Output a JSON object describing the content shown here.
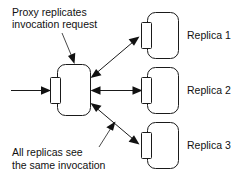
{
  "diagram": {
    "background_color": "#ffffff",
    "line_color": "#1a1a1a",
    "text_color": "#111111",
    "annotations": {
      "top": {
        "line1": "Proxy replicates",
        "line2": "invocation request"
      },
      "bottom": {
        "line1": "All replicas see",
        "line2": "the same invocation"
      }
    },
    "nodes": {
      "proxy": {
        "label": ""
      },
      "replicas": [
        {
          "label": "Replica 1"
        },
        {
          "label": "Replica 2"
        },
        {
          "label": "Replica 3"
        }
      ]
    },
    "connections": [
      {
        "name": "client-to-proxy",
        "from": "client",
        "to": "proxy",
        "heads": 1
      },
      {
        "name": "proxy-to-replica-1",
        "from": "proxy",
        "to": "Replica 1",
        "heads": 2
      },
      {
        "name": "proxy-to-replica-2",
        "from": "proxy",
        "to": "Replica 2",
        "heads": 2
      },
      {
        "name": "proxy-to-replica-3",
        "from": "proxy",
        "to": "Replica 3",
        "heads": 2
      }
    ]
  }
}
